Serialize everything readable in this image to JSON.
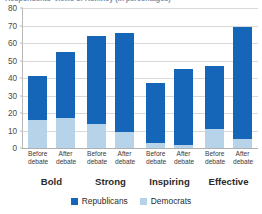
{
  "chart_data": {
    "type": "bar",
    "subtype": "stacked-grouped-column",
    "title": "Respondents' views of Romney (in percentages)",
    "xlabel": "",
    "ylabel": "",
    "ylim": [
      0,
      80
    ],
    "yticks": [
      0,
      10,
      20,
      30,
      40,
      50,
      60,
      70,
      80
    ],
    "grid": true,
    "legend_position": "bottom",
    "groups": [
      "Bold",
      "Strong",
      "Inspiring",
      "Effective"
    ],
    "subcategories": [
      "Before debate",
      "After debate"
    ],
    "subcategory_lines": [
      {
        "line1": "Before",
        "line2": "debate"
      },
      {
        "line1": "After",
        "line2": "debate"
      }
    ],
    "categories": [
      "Bold Before debate",
      "Bold After debate",
      "Strong Before debate",
      "Strong After debate",
      "Inspiring Before debate",
      "Inspiring After debate",
      "Effective Before debate",
      "Effective After debate"
    ],
    "series": [
      {
        "name": "Democrats",
        "color": "#b6d3ea",
        "values": [
          16,
          17,
          14,
          9,
          3,
          2,
          11,
          5
        ]
      },
      {
        "name": "Republicans",
        "color": "#1565b8",
        "values": [
          25,
          38,
          50,
          57,
          34,
          43,
          36,
          64
        ]
      }
    ],
    "totals": [
      41,
      55,
      64,
      66,
      37,
      45,
      47,
      69
    ],
    "bars": [
      {
        "group": "Bold",
        "sub": "Before debate",
        "democrats": 16,
        "republicans": 25,
        "total": 41
      },
      {
        "group": "Bold",
        "sub": "After debate",
        "democrats": 17,
        "republicans": 38,
        "total": 55
      },
      {
        "group": "Strong",
        "sub": "Before debate",
        "democrats": 14,
        "republicans": 50,
        "total": 64
      },
      {
        "group": "Strong",
        "sub": "After debate",
        "democrats": 9,
        "republicans": 57,
        "total": 66
      },
      {
        "group": "Inspiring",
        "sub": "Before debate",
        "democrats": 3,
        "republicans": 34,
        "total": 37
      },
      {
        "group": "Inspiring",
        "sub": "After debate",
        "democrats": 2,
        "republicans": 43,
        "total": 45
      },
      {
        "group": "Effective",
        "sub": "Before debate",
        "democrats": 11,
        "republicans": 36,
        "total": 47
      },
      {
        "group": "Effective",
        "sub": "After debate",
        "democrats": 5,
        "republicans": 64,
        "total": 69
      }
    ]
  },
  "legend": {
    "items": [
      {
        "label": "Republicans",
        "color": "#1565b8"
      },
      {
        "label": "Democrats",
        "color": "#b6d3ea"
      }
    ]
  },
  "colors": {
    "republicans": "#1565b8",
    "democrats": "#b6d3ea",
    "gridline": "#d9d9d9",
    "title": "#1f4e79"
  }
}
